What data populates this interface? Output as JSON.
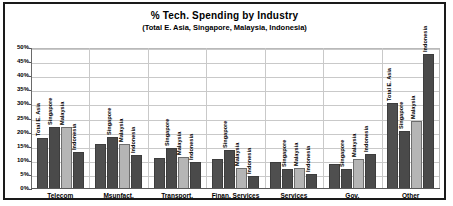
{
  "chart_data": {
    "type": "bar",
    "title": "% Tech. Spending by Industry",
    "subtitle": "(Total E. Asia, Singapore, Malaysia, Indonesia)",
    "xlabel": "",
    "ylabel": "",
    "ylim": [
      0,
      50
    ],
    "ytick_labels": [
      "50%",
      "45%",
      "40%",
      "35%",
      "30%",
      "25%",
      "20%",
      "15%",
      "10%",
      "5%",
      "0%"
    ],
    "ytick_values": [
      50,
      45,
      40,
      35,
      30,
      25,
      20,
      15,
      10,
      5,
      0
    ],
    "grid": true,
    "legend_position": "none",
    "bar_labels_rotated": true,
    "categories": [
      "Telecom",
      "Msunfact.",
      "Transport.",
      "Finan. Services",
      "Services",
      "Gov.",
      "Other"
    ],
    "series": [
      {
        "name": "Total E. Asia",
        "values": [
          18,
          16,
          11,
          10.5,
          9.5,
          9,
          30.5
        ]
      },
      {
        "name": "Singapore",
        "values": [
          22,
          18.5,
          14.5,
          14,
          7,
          7,
          20.5
        ]
      },
      {
        "name": "Malaysia",
        "values": [
          22,
          16,
          11.5,
          7.5,
          7.5,
          10.5,
          24
        ]
      },
      {
        "name": "Indonesia",
        "values": [
          13,
          12,
          9.5,
          4.5,
          5.5,
          12.5,
          48
        ]
      }
    ],
    "bar_annotations": [
      [
        "Total E. Asia",
        "Singapore",
        "Malaysia",
        "Indonesia"
      ],
      [
        "",
        "Singapore",
        "Malaysia",
        "Indonesia"
      ],
      [
        "",
        "Singapore",
        "Malaysia",
        "Indonesia"
      ],
      [
        "",
        "Singapore",
        "Malaysia",
        "Indonesia"
      ],
      [
        "",
        "Singapore",
        "Malaysia",
        "Indonesia"
      ],
      [
        "",
        "Singapore",
        "Malaysia",
        "Indonesia"
      ],
      [
        "Total E. Asia",
        "Singapore",
        "Malaysia",
        "Indonesia"
      ]
    ],
    "colors": {
      "series_total_e_asia": "#4f4f4f",
      "series_singapore": "#4a4a4a",
      "series_malaysia": "#b5b5b5",
      "series_indonesia": "#4a4a4a",
      "grid": "#c9c9c9",
      "frame": "#1a1a1a",
      "background": "#ffffff"
    }
  }
}
